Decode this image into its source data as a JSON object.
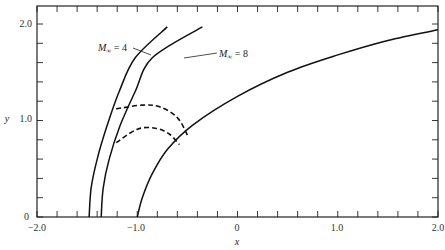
{
  "chart_data": {
    "type": "line",
    "title": "",
    "xlabel": "x",
    "ylabel": "y",
    "xlim": [
      -2.0,
      2.0
    ],
    "ylim": [
      0,
      2.2
    ],
    "x_ticks": [
      -2.0,
      -1.0,
      0,
      1.0,
      2.0
    ],
    "x_tick_labels": [
      "−2.0",
      "−1.0",
      "0",
      "1.0",
      "2.0"
    ],
    "x_minor_step": 0.2,
    "y_ticks": [
      0,
      1.0,
      2.0
    ],
    "y_tick_labels": [
      "0",
      "1.0",
      "2.0"
    ],
    "y_minor_step": 0.2,
    "grid": false,
    "legend": "none",
    "series": [
      {
        "name": "Shock wave, M∞ = 4",
        "style": "solid",
        "points": [
          [
            -1.48,
            0.0
          ],
          [
            -1.46,
            0.3
          ],
          [
            -1.4,
            0.6
          ],
          [
            -1.3,
            0.95
          ],
          [
            -1.18,
            1.3
          ],
          [
            -1.02,
            1.65
          ],
          [
            -0.7,
            1.97
          ]
        ]
      },
      {
        "name": "Shock wave, M∞ = 8",
        "style": "solid",
        "points": [
          [
            -1.36,
            0.0
          ],
          [
            -1.34,
            0.3
          ],
          [
            -1.28,
            0.6
          ],
          [
            -1.17,
            0.95
          ],
          [
            -1.02,
            1.3
          ],
          [
            -0.85,
            1.65
          ],
          [
            -0.35,
            1.97
          ]
        ]
      },
      {
        "name": "Body surface",
        "style": "solid",
        "points": [
          [
            -1.0,
            0.0
          ],
          [
            -0.95,
            0.2
          ],
          [
            -0.85,
            0.45
          ],
          [
            -0.7,
            0.7
          ],
          [
            -0.45,
            0.95
          ],
          [
            0.0,
            1.25
          ],
          [
            0.5,
            1.5
          ],
          [
            1.0,
            1.68
          ],
          [
            1.5,
            1.83
          ],
          [
            2.0,
            1.94
          ]
        ]
      },
      {
        "name": "Sonic line, M∞ = 4",
        "style": "dashed",
        "points": [
          [
            -1.21,
            1.12
          ],
          [
            -0.95,
            1.16
          ],
          [
            -0.77,
            1.14
          ],
          [
            -0.6,
            1.03
          ],
          [
            -0.5,
            0.85
          ]
        ]
      },
      {
        "name": "Sonic line, M∞ = 8",
        "style": "dashed",
        "points": [
          [
            -1.21,
            0.77
          ],
          [
            -1.0,
            0.91
          ],
          [
            -0.82,
            0.92
          ],
          [
            -0.68,
            0.86
          ],
          [
            -0.58,
            0.75
          ]
        ]
      }
    ],
    "annotations": [
      {
        "text": "M∞ = 4",
        "x": -1.62,
        "y": 1.69,
        "points_to": "M∞ = 4 shock"
      },
      {
        "text": "M∞ = 8",
        "x": -0.55,
        "y": 1.61,
        "points_to": "M∞ = 8 shock"
      }
    ]
  },
  "labels": {
    "x_axis": "x",
    "y_axis": "y",
    "ann4_m": "M",
    "ann4_sub": "∞",
    "ann4_rest": " = 4",
    "ann8_m": "M",
    "ann8_sub": "∞",
    "ann8_rest": " = 8",
    "xt0": "−2.0",
    "xt1": "−1.0",
    "xt2": "0",
    "xt3": "1.0",
    "xt4": "2.0",
    "yt0": "0",
    "yt1": "1.0",
    "yt2": "2.0"
  }
}
